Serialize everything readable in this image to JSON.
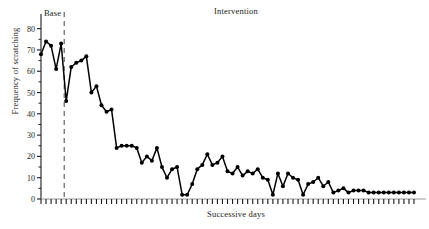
{
  "chart_data": {
    "type": "line",
    "title": "",
    "xlabel": "Successive days",
    "ylabel": "Frequency of scratching",
    "ylim": [
      0,
      85
    ],
    "yticks": [
      0,
      10,
      20,
      30,
      40,
      50,
      60,
      70,
      80
    ],
    "ytick_labels": [
      "0",
      "10",
      "20",
      "30",
      "40",
      "50",
      "60",
      "70",
      "80"
    ],
    "xlim": [
      1,
      75
    ],
    "grid": false,
    "legend": false,
    "marker": "filled-circle",
    "line_color": "#000000",
    "annotations": [
      {
        "name": "phase-label-base",
        "text": "Base",
        "x": 3,
        "y": 84
      },
      {
        "name": "phase-label-intervention",
        "text": "Intervention",
        "x": 40,
        "y": 85
      },
      {
        "name": "phase-divider",
        "text": "",
        "type": "vertical-dashed-line",
        "x": 6
      }
    ],
    "phases": [
      {
        "label": "Base",
        "start_day": 1,
        "end_day": 5
      },
      {
        "label": "Intervention",
        "start_day": 6,
        "end_day": 75
      }
    ],
    "series": [
      {
        "name": "Frequency of scratching",
        "x": [
          1,
          2,
          3,
          4,
          5,
          6,
          7,
          8,
          9,
          10,
          11,
          12,
          13,
          14,
          15,
          16,
          17,
          18,
          19,
          20,
          21,
          22,
          23,
          24,
          25,
          26,
          27,
          28,
          29,
          30,
          31,
          32,
          33,
          34,
          35,
          36,
          37,
          38,
          39,
          40,
          41,
          42,
          43,
          44,
          45,
          46,
          47,
          48,
          49,
          50,
          51,
          52,
          53,
          54,
          55,
          56,
          57,
          58,
          59,
          60,
          61,
          62,
          63,
          64,
          65,
          66,
          67,
          68,
          69,
          70,
          71,
          72,
          73,
          74,
          75
        ],
        "values": [
          68,
          74,
          72,
          61,
          73,
          46,
          62,
          64,
          65,
          67,
          50,
          53,
          44,
          41,
          42,
          24,
          25,
          25,
          25,
          24,
          17,
          20,
          18,
          24,
          15,
          10,
          14,
          15,
          2,
          2,
          7,
          14,
          16,
          21,
          16,
          17,
          20,
          13,
          12,
          15,
          11,
          13,
          12,
          14,
          10,
          9,
          2,
          12,
          6,
          12,
          10,
          9,
          2,
          7,
          8,
          10,
          6,
          8,
          3,
          4,
          5,
          3,
          4,
          4,
          4,
          3,
          3,
          3,
          3,
          3,
          3,
          3,
          3,
          3,
          3
        ]
      }
    ]
  }
}
